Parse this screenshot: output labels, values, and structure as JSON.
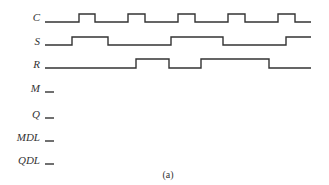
{
  "diagram": {
    "caption": "(a)",
    "line_color": "#333333",
    "signals": [
      {
        "name": "C",
        "label_y": 21,
        "low_y": 22,
        "high_y": 14,
        "start_x": 45,
        "end_x": 311,
        "initial": 0,
        "transitions": [
          79,
          95,
          128,
          145,
          178,
          195,
          228,
          245,
          278,
          295
        ]
      },
      {
        "name": "S",
        "label_y": 45,
        "low_y": 45,
        "high_y": 37,
        "start_x": 45,
        "end_x": 311,
        "initial": 0,
        "transitions": [
          72,
          108,
          171,
          223,
          286
        ]
      },
      {
        "name": "R",
        "label_y": 68,
        "low_y": 68,
        "high_y": 59,
        "start_x": 45,
        "end_x": 311,
        "initial": 0,
        "transitions": [
          136,
          169,
          201,
          269
        ]
      },
      {
        "name": "M",
        "label_y": 92,
        "low_y": 92,
        "high_y": 84,
        "start_x": 45,
        "end_x": 54,
        "initial": 0,
        "transitions": []
      },
      {
        "name": "Q",
        "label_y": 118,
        "low_y": 118,
        "high_y": 110,
        "start_x": 45,
        "end_x": 54,
        "initial": 0,
        "transitions": []
      },
      {
        "name": "MDL",
        "label_y": 141,
        "low_y": 141,
        "high_y": 133,
        "start_x": 45,
        "end_x": 54,
        "initial": 0,
        "transitions": []
      },
      {
        "name": "QDL",
        "label_y": 164,
        "low_y": 164,
        "high_y": 156,
        "start_x": 45,
        "end_x": 54,
        "initial": 0,
        "transitions": []
      }
    ]
  }
}
